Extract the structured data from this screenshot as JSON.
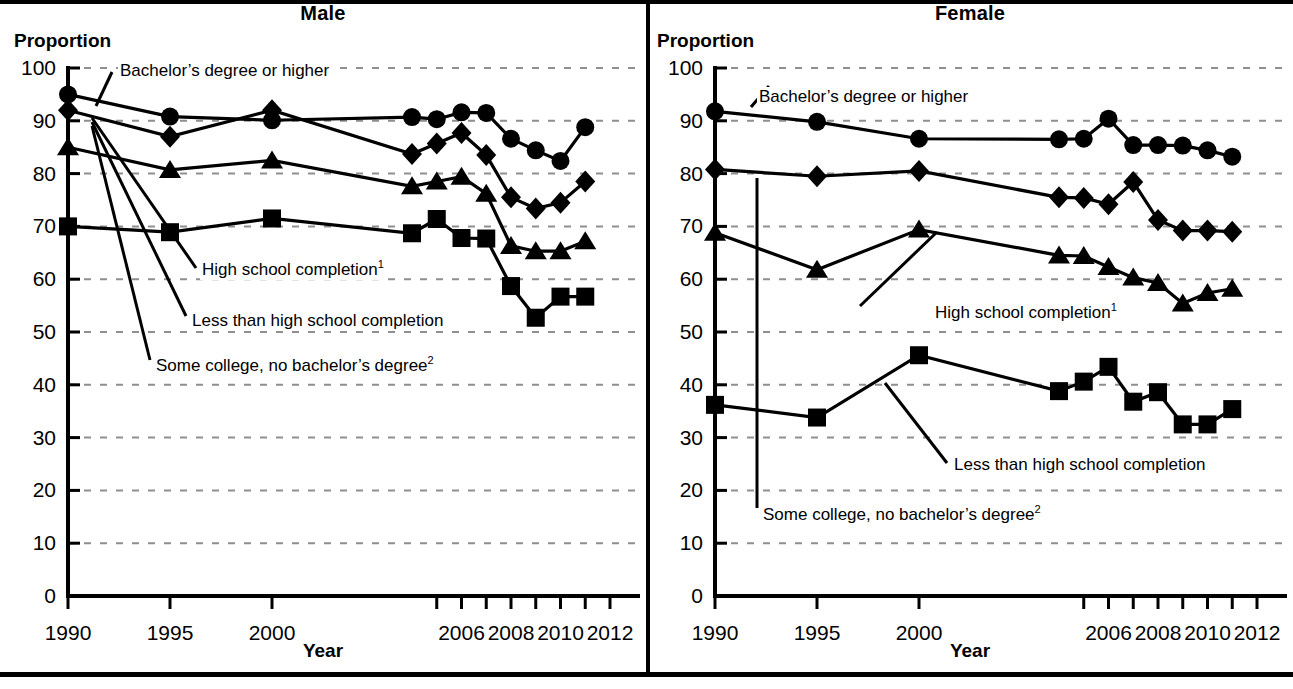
{
  "figure": {
    "panels": [
      {
        "id": "male",
        "title": "Male",
        "y_axis_label": "Proportion",
        "x_axis_label": "Year"
      },
      {
        "id": "female",
        "title": "Female",
        "y_axis_label": "Proportion",
        "x_axis_label": "Year"
      }
    ],
    "annotations": {
      "bachelors": "Bachelor’s degree or higher",
      "high_school": "High school completion",
      "high_school_sup": "1",
      "less_than_hs": "Less than high school completion",
      "some_college": "Some college, no bachelor’s degree",
      "some_college_sup": "2"
    },
    "y_ticks": [
      "0",
      "10",
      "20",
      "30",
      "40",
      "50",
      "60",
      "70",
      "80",
      "90",
      "100"
    ],
    "x_ticks": [
      "1990",
      "1995",
      "2000",
      "2006",
      "2008",
      "2010",
      "2012"
    ]
  },
  "chart_data": [
    {
      "type": "line",
      "title": "Male",
      "xlabel": "Year",
      "ylabel": "Proportion",
      "ylim": [
        0,
        100
      ],
      "yticks": [
        0,
        10,
        20,
        30,
        40,
        50,
        60,
        70,
        80,
        90,
        100
      ],
      "x": [
        1990,
        1995,
        2000,
        2004,
        2005,
        2006,
        2007,
        2008,
        2009,
        2010,
        2011,
        2012
      ],
      "xtick_labels": [
        "1990",
        "1995",
        "2000",
        "",
        "",
        "2006",
        "",
        "2008",
        "",
        "2010",
        "",
        "2012"
      ],
      "grid": "dotted-horizontal",
      "legend": "inline-annotations",
      "series": [
        {
          "name": "Bachelor’s degree or higher",
          "marker": "circle",
          "values": [
            95.0,
            90.8,
            90.1,
            90.7,
            90.3,
            91.6,
            91.5,
            86.6,
            84.4,
            82.4,
            88.8,
            null
          ],
          "x": [
            1990,
            1995,
            2000,
            2004,
            2005,
            2006,
            2007,
            2008,
            2009,
            2010,
            2011
          ]
        },
        {
          "name": "Some college, no bachelor’s degree",
          "marker": "diamond",
          "values": [
            92.0,
            87.0,
            92.0,
            83.7,
            85.7,
            87.7,
            83.5,
            75.5,
            73.4,
            74.5,
            78.5
          ],
          "x": [
            1990,
            1995,
            2000,
            2004,
            2005,
            2006,
            2007,
            2008,
            2009,
            2010,
            2011
          ]
        },
        {
          "name": "High school completion",
          "marker": "triangle",
          "values": [
            85.0,
            80.7,
            82.5,
            77.6,
            78.5,
            79.4,
            76.2,
            66.3,
            65.3,
            65.3,
            67.2
          ],
          "x": [
            1990,
            1995,
            2000,
            2004,
            2005,
            2006,
            2007,
            2008,
            2009,
            2010,
            2011
          ]
        },
        {
          "name": "Less than high school completion",
          "marker": "square",
          "values": [
            70.0,
            68.9,
            71.5,
            68.7,
            71.4,
            67.8,
            67.7,
            58.7,
            52.7,
            56.7,
            56.7
          ],
          "x": [
            1990,
            1995,
            2000,
            2004,
            2005,
            2006,
            2007,
            2008,
            2009,
            2010,
            2011
          ]
        }
      ]
    },
    {
      "type": "line",
      "title": "Female",
      "xlabel": "Year",
      "ylabel": "Proportion",
      "ylim": [
        0,
        100
      ],
      "yticks": [
        0,
        10,
        20,
        30,
        40,
        50,
        60,
        70,
        80,
        90,
        100
      ],
      "x": [
        1990,
        1995,
        2000,
        2004,
        2005,
        2006,
        2007,
        2008,
        2009,
        2010,
        2011,
        2012
      ],
      "xtick_labels": [
        "1990",
        "1995",
        "2000",
        "",
        "",
        "2006",
        "",
        "2008",
        "",
        "2010",
        "",
        "2012"
      ],
      "grid": "dotted-horizontal",
      "legend": "inline-annotations",
      "series": [
        {
          "name": "Bachelor’s degree or higher",
          "marker": "circle",
          "values": [
            91.8,
            89.8,
            86.6,
            86.5,
            86.6,
            90.4,
            85.4,
            85.4,
            85.3,
            84.4,
            83.2
          ],
          "x": [
            1990,
            1995,
            2000,
            2004,
            2005,
            2006,
            2007,
            2008,
            2009,
            2010,
            2011
          ]
        },
        {
          "name": "Some college, no bachelor’s degree",
          "marker": "diamond",
          "values": [
            80.8,
            79.5,
            80.5,
            75.5,
            75.4,
            74.2,
            78.4,
            71.2,
            69.2,
            69.2,
            69.0
          ],
          "x": [
            1990,
            1995,
            2000,
            2004,
            2005,
            2006,
            2007,
            2008,
            2009,
            2010,
            2011
          ]
        },
        {
          "name": "High school completion",
          "marker": "triangle",
          "values": [
            68.8,
            61.8,
            69.4,
            64.5,
            64.4,
            62.3,
            60.3,
            59.3,
            55.4,
            57.4,
            58.2
          ],
          "x": [
            1990,
            1995,
            2000,
            2004,
            2005,
            2006,
            2007,
            2008,
            2009,
            2010,
            2011
          ]
        },
        {
          "name": "Less than high school completion",
          "marker": "square",
          "values": [
            36.2,
            33.8,
            45.6,
            38.8,
            40.6,
            43.4,
            36.8,
            38.6,
            32.5,
            32.5,
            35.4
          ],
          "x": [
            1990,
            1995,
            2000,
            2004,
            2005,
            2006,
            2007,
            2008,
            2009,
            2010,
            2011
          ]
        }
      ]
    }
  ]
}
